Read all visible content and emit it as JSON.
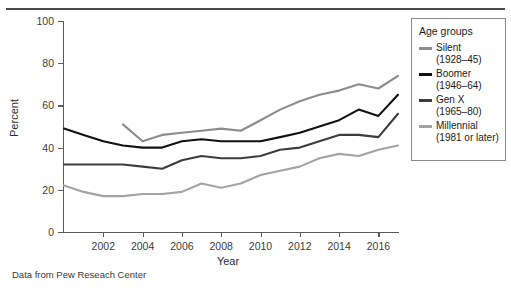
{
  "caption": "Data from Pew Reseach Center",
  "legend": {
    "title": "Age groups",
    "items": [
      {
        "label": "Silent",
        "years": "(1928–45)",
        "color": "#8c8c8c"
      },
      {
        "label": "Boomer",
        "years": "(1946–64)",
        "color": "#111111"
      },
      {
        "label": "Gen X",
        "years": "(1965–80)",
        "color": "#3d3d3d"
      },
      {
        "label": "Millennial",
        "years": "(1981 or later)",
        "color": "#a3a3a3"
      }
    ]
  },
  "chart_data": {
    "type": "line",
    "title": "",
    "xlabel": "Year",
    "ylabel": "Percent",
    "xlim": [
      2000,
      2017
    ],
    "ylim": [
      0,
      100
    ],
    "xticks": [
      2002,
      2004,
      2006,
      2008,
      2010,
      2012,
      2014,
      2016
    ],
    "yticks": [
      0,
      20,
      40,
      60,
      80,
      100
    ],
    "grid": false,
    "legend_position": "right",
    "series": [
      {
        "name": "Silent (1928–45)",
        "color": "#8c8c8c",
        "x": [
          2003,
          2004,
          2005,
          2006,
          2007,
          2008,
          2009,
          2010,
          2011,
          2012,
          2013,
          2014,
          2015,
          2016,
          2017
        ],
        "values": [
          51,
          43,
          46,
          47,
          48,
          49,
          48,
          53,
          58,
          62,
          65,
          67,
          70,
          68,
          74
        ]
      },
      {
        "name": "Boomer (1946–64)",
        "color": "#111111",
        "x": [
          2000,
          2001,
          2002,
          2003,
          2004,
          2005,
          2006,
          2007,
          2008,
          2009,
          2010,
          2011,
          2012,
          2013,
          2014,
          2015,
          2016,
          2017
        ],
        "values": [
          49,
          46,
          43,
          41,
          40,
          40,
          43,
          44,
          43,
          43,
          43,
          45,
          47,
          50,
          53,
          58,
          55,
          65
        ]
      },
      {
        "name": "Gen X (1965–80)",
        "color": "#3d3d3d",
        "x": [
          2000,
          2001,
          2002,
          2003,
          2004,
          2005,
          2006,
          2007,
          2008,
          2009,
          2010,
          2011,
          2012,
          2013,
          2014,
          2015,
          2016,
          2017
        ],
        "values": [
          32,
          32,
          32,
          32,
          31,
          30,
          34,
          36,
          35,
          35,
          36,
          39,
          40,
          43,
          46,
          46,
          45,
          56
        ]
      },
      {
        "name": "Millennial (1981 or later)",
        "color": "#a3a3a3",
        "x": [
          2000,
          2001,
          2002,
          2003,
          2004,
          2005,
          2006,
          2007,
          2008,
          2009,
          2010,
          2011,
          2012,
          2013,
          2014,
          2015,
          2016,
          2017
        ],
        "values": [
          22,
          19,
          17,
          17,
          18,
          18,
          19,
          23,
          21,
          23,
          27,
          29,
          31,
          35,
          37,
          36,
          39,
          41
        ]
      }
    ]
  }
}
